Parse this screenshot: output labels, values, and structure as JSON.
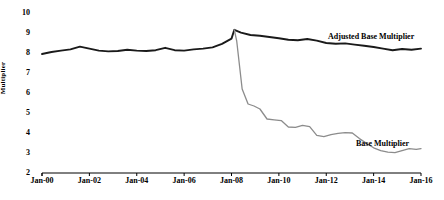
{
  "chart_data": {
    "type": "line",
    "title": "",
    "xlabel": "",
    "ylabel": "Multiplier",
    "ylim": [
      2,
      10
    ],
    "xlim": [
      "Jan-00",
      "Jan-16"
    ],
    "grid": false,
    "legend_position": "inline-annotation",
    "yticks": [
      "10",
      "9",
      "8",
      "7",
      "6",
      "5",
      "4",
      "3",
      "2"
    ],
    "ytick_values": [
      10,
      9,
      8,
      7,
      6,
      5,
      4,
      3,
      2
    ],
    "xticks": [
      "Jan-00",
      "Jan-02",
      "Jan-04",
      "Jan-06",
      "Jan-08",
      "Jan-10",
      "Jan-12",
      "Jan-14",
      "Jan-16"
    ],
    "xtick_values": [
      2000,
      2002,
      2004,
      2006,
      2008,
      2010,
      2012,
      2014,
      2016
    ],
    "series": [
      {
        "name": "Adjusted Base Multiplier",
        "color": "#1a1a1a",
        "width": 1.9,
        "x": [
          2000.0,
          2000.4,
          2000.8,
          2001.2,
          2001.6,
          2002.0,
          2002.4,
          2002.8,
          2003.2,
          2003.6,
          2004.0,
          2004.4,
          2004.8,
          2005.2,
          2005.6,
          2006.0,
          2006.4,
          2006.8,
          2007.2,
          2007.6,
          2008.0,
          2008.12,
          2008.4,
          2008.8,
          2009.2,
          2009.6,
          2010.0,
          2010.4,
          2010.8,
          2011.2,
          2011.6,
          2012.0,
          2012.4,
          2012.8,
          2013.2,
          2013.6,
          2014.0,
          2014.4,
          2014.8,
          2015.2,
          2015.6,
          2016.0
        ],
        "values": [
          7.95,
          8.05,
          8.12,
          8.18,
          8.32,
          8.22,
          8.12,
          8.08,
          8.1,
          8.16,
          8.12,
          8.1,
          8.14,
          8.26,
          8.14,
          8.12,
          8.18,
          8.22,
          8.28,
          8.46,
          8.72,
          9.16,
          9.02,
          8.9,
          8.86,
          8.8,
          8.74,
          8.66,
          8.64,
          8.7,
          8.62,
          8.5,
          8.46,
          8.48,
          8.42,
          8.36,
          8.3,
          8.22,
          8.14,
          8.2,
          8.16,
          8.22
        ]
      },
      {
        "name": "Base Multiplier",
        "color": "#8c8c8c",
        "width": 1.3,
        "x": [
          2008.12,
          2008.22,
          2008.45,
          2008.7,
          2008.95,
          2009.2,
          2009.5,
          2009.8,
          2010.1,
          2010.4,
          2010.7,
          2011.0,
          2011.3,
          2011.6,
          2011.9,
          2012.2,
          2012.5,
          2012.8,
          2013.1,
          2013.4,
          2013.7,
          2014.0,
          2014.3,
          2014.6,
          2014.9,
          2015.2,
          2015.5,
          2015.8,
          2016.0
        ],
        "values": [
          9.16,
          8.6,
          6.2,
          5.45,
          5.35,
          5.2,
          4.7,
          4.66,
          4.62,
          4.3,
          4.28,
          4.38,
          4.32,
          3.88,
          3.82,
          3.92,
          3.98,
          4.02,
          4.0,
          3.72,
          3.48,
          3.26,
          3.12,
          3.04,
          3.02,
          3.12,
          3.22,
          3.18,
          3.22
        ]
      }
    ],
    "annotations": [
      {
        "text": "Adjusted Base Multiplier",
        "x_px": 328,
        "y_px": 33
      },
      {
        "text": "Base Multiplier",
        "x_px": 356,
        "y_px": 140
      }
    ]
  }
}
